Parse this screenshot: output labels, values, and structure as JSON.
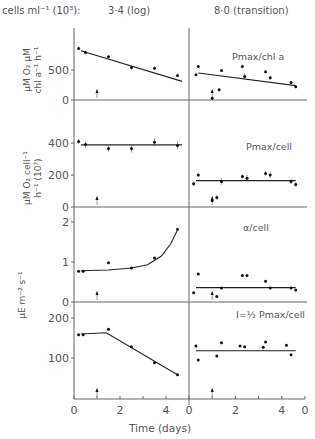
{
  "chart_data": {
    "type": "scatter",
    "header": {
      "label": "cells ml⁻¹ (10³):",
      "left_condition": "3·4 (log)",
      "right_condition": "8·0 (transition)"
    },
    "xlabel": "Time (days)",
    "x_ticks_left": [
      "0",
      "2",
      "4"
    ],
    "x_ticks_right": [
      "0",
      "2",
      "4",
      "0"
    ],
    "xlim": [
      0,
      5
    ],
    "arrow_day": 1,
    "panels": [
      {
        "id": "pmax-chl",
        "label": "Pmax/chl a",
        "ylabel": "μM O₂ μM chl a⁻¹ h⁻¹",
        "ylim": [
          0,
          900
        ],
        "yticks": [
          "0",
          "500"
        ],
        "ytick_values": [
          0,
          500
        ],
        "left": {
          "points": [
            [
              0.2,
              860,
              60
            ],
            [
              0.5,
              790,
              50
            ],
            [
              1.5,
              720,
              40
            ],
            [
              2.5,
              540,
              70
            ],
            [
              3.5,
              530,
              60
            ],
            [
              4.5,
              410,
              60
            ]
          ],
          "fit": [
            [
              0.3,
              820
            ],
            [
              4.7,
              310
            ]
          ]
        },
        "right": {
          "points": [
            [
              0.3,
              420,
              50
            ],
            [
              0.4,
              560,
              40
            ],
            [
              1.0,
              30,
              60
            ],
            [
              1.3,
              170,
              40
            ],
            [
              1.4,
              490,
              50
            ],
            [
              2.3,
              560,
              70
            ],
            [
              2.4,
              390,
              120
            ],
            [
              3.3,
              470,
              50
            ],
            [
              3.5,
              370,
              80
            ],
            [
              4.4,
              290,
              50
            ],
            [
              4.6,
              220,
              40
            ]
          ],
          "fit": [
            [
              0.4,
              450
            ],
            [
              4.6,
              240
            ]
          ]
        }
      },
      {
        "id": "pmax-cell",
        "label": "Pmax/cell",
        "ylabel": "μM O₂ cell⁻¹ h⁻¹ (10⁷)",
        "ylim": [
          0,
          500
        ],
        "yticks": [
          "0",
          "200",
          "400"
        ],
        "ytick_values": [
          0,
          200,
          400
        ],
        "left": {
          "points": [
            [
              0.2,
              410,
              30
            ],
            [
              0.5,
              390,
              40
            ],
            [
              1.5,
              365,
              40
            ],
            [
              2.5,
              365,
              50
            ],
            [
              3.5,
              405,
              50
            ],
            [
              4.5,
              385,
              50
            ]
          ],
          "fit": [
            [
              0.3,
              388
            ],
            [
              4.7,
              388
            ]
          ]
        },
        "right": {
          "points": [
            [
              0.2,
              145,
              30
            ],
            [
              0.4,
              200,
              20
            ],
            [
              1.0,
              40,
              30
            ],
            [
              1.2,
              60,
              30
            ],
            [
              1.4,
              160,
              40
            ],
            [
              2.3,
              190,
              30
            ],
            [
              2.5,
              180,
              40
            ],
            [
              3.3,
              210,
              30
            ],
            [
              3.5,
              200,
              40
            ],
            [
              4.4,
              160,
              30
            ],
            [
              4.6,
              140,
              30
            ]
          ],
          "fit": [
            [
              0.3,
              165
            ],
            [
              4.6,
              165
            ]
          ]
        }
      },
      {
        "id": "alpha-cell",
        "label": "α/cell",
        "ylabel": "μE m⁻² s⁻¹",
        "ylim": [
          0,
          2.3
        ],
        "yticks": [
          "0",
          "1",
          "2"
        ],
        "ytick_values": [
          0,
          1,
          2
        ],
        "left": {
          "points": [
            [
              0.2,
              0.77
            ],
            [
              0.4,
              0.77
            ],
            [
              1.5,
              0.98
            ],
            [
              2.5,
              0.85
            ],
            [
              3.5,
              1.1
            ],
            [
              4.5,
              1.82
            ]
          ],
          "fit_curve": [
            [
              0.3,
              0.78
            ],
            [
              1.5,
              0.8
            ],
            [
              2.5,
              0.85
            ],
            [
              3.2,
              0.93
            ],
            [
              3.8,
              1.15
            ],
            [
              4.2,
              1.45
            ],
            [
              4.5,
              1.8
            ]
          ]
        },
        "right": {
          "points": [
            [
              0.2,
              0.23
            ],
            [
              0.4,
              0.7
            ],
            [
              1.2,
              0.14
            ],
            [
              1.4,
              0.35
            ],
            [
              2.3,
              0.66
            ],
            [
              2.5,
              0.66
            ],
            [
              3.3,
              0.52
            ],
            [
              3.5,
              0.35
            ],
            [
              4.4,
              0.35
            ],
            [
              4.6,
              0.3
            ]
          ],
          "fit": [
            [
              0.3,
              0.36
            ],
            [
              4.6,
              0.36
            ]
          ]
        }
      },
      {
        "id": "ik-cell",
        "label": "I=½ Pmax/cell",
        "ylabel": "",
        "ylim": [
          0,
          220
        ],
        "yticks": [
          "100",
          "200"
        ],
        "ytick_values": [
          100,
          200
        ],
        "left": {
          "points": [
            [
              0.2,
              158
            ],
            [
              0.4,
              158
            ],
            [
              1.5,
              172
            ],
            [
              2.5,
              128
            ],
            [
              3.5,
              88
            ],
            [
              4.5,
              58
            ]
          ],
          "fit": [
            [
              0.3,
              160
            ],
            [
              1.4,
              163
            ],
            [
              4.5,
              58
            ]
          ]
        },
        "right": {
          "points": [
            [
              0.3,
              130
            ],
            [
              0.4,
              95
            ],
            [
              1.2,
              105
            ],
            [
              1.4,
              138
            ],
            [
              2.2,
              130
            ],
            [
              2.4,
              128
            ],
            [
              3.2,
              127
            ],
            [
              3.3,
              140
            ],
            [
              4.2,
              132
            ],
            [
              4.4,
              108
            ]
          ],
          "fit": [
            [
              0.3,
              118
            ],
            [
              4.6,
              118
            ]
          ]
        }
      }
    ]
  }
}
